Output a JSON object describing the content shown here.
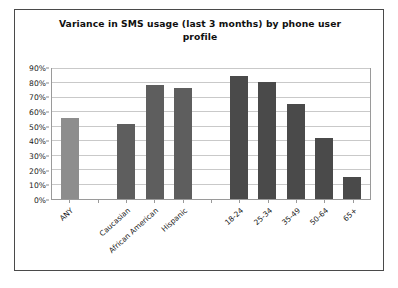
{
  "chart_data": {
    "type": "bar",
    "title": "Variance in SMS usage (last 3 months) by phone user profile",
    "xlabel": "",
    "ylabel": "",
    "ylim": [
      0,
      90
    ],
    "grid": true,
    "legend": "none",
    "ytick_labels": [
      "90%",
      "80%",
      "70%",
      "60%",
      "50%",
      "40%",
      "30%",
      "20%",
      "10%",
      "0%"
    ],
    "ytick_values": [
      90,
      80,
      70,
      60,
      50,
      40,
      30,
      20,
      10,
      0
    ],
    "categories": [
      "ANY",
      "",
      "Caucasian",
      "African American",
      "Hispanic",
      "",
      "18-24",
      "25-34",
      "35-49",
      "50-64",
      "65+"
    ],
    "values": [
      56,
      null,
      52,
      79,
      77,
      null,
      85,
      81,
      66,
      42,
      15
    ],
    "bar_colors": [
      "#8d8d8d",
      null,
      "#5e5e5e",
      "#5e5e5e",
      "#5e5e5e",
      null,
      "#4a4a4a",
      "#4a4a4a",
      "#4a4a4a",
      "#4a4a4a",
      "#4a4a4a"
    ],
    "groups": [
      {
        "name": "overall",
        "categories": [
          "ANY"
        ],
        "color": "#8d8d8d"
      },
      {
        "name": "ethnicity",
        "categories": [
          "Caucasian",
          "African American",
          "Hispanic"
        ],
        "color": "#5e5e5e"
      },
      {
        "name": "age",
        "categories": [
          "18-24",
          "25-34",
          "35-49",
          "50-64",
          "65+"
        ],
        "color": "#4a4a4a"
      }
    ]
  },
  "colors": {
    "frame_border": "#4a4a4a",
    "plot_border": "#9a9a9a",
    "gridline": "#c9c9c9",
    "background": "#ffffff",
    "text": "#101010"
  }
}
